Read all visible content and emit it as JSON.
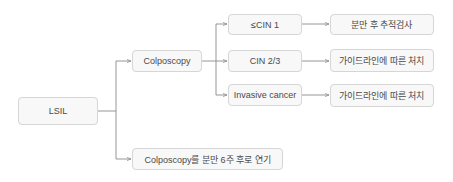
{
  "diagram": {
    "root": {
      "label": "LSIL"
    },
    "branch_colposcopy": {
      "label": "Colposcopy"
    },
    "branch_delay": {
      "label": "Colposcopy를 분만 6주 후로 연기"
    },
    "results": [
      {
        "label": "≤CIN 1",
        "action": "분만 후 추적검사"
      },
      {
        "label": "CIN 2/3",
        "action": "가이드라인에 따른 처치"
      },
      {
        "label": "Invasive cancer",
        "action": "가이드라인에 따른 처치"
      }
    ],
    "colors": {
      "box_fill": "#f8f8f8",
      "box_border": "#d6d6d6",
      "text": "#4a4a4a",
      "line": "#8a8a8a"
    }
  }
}
